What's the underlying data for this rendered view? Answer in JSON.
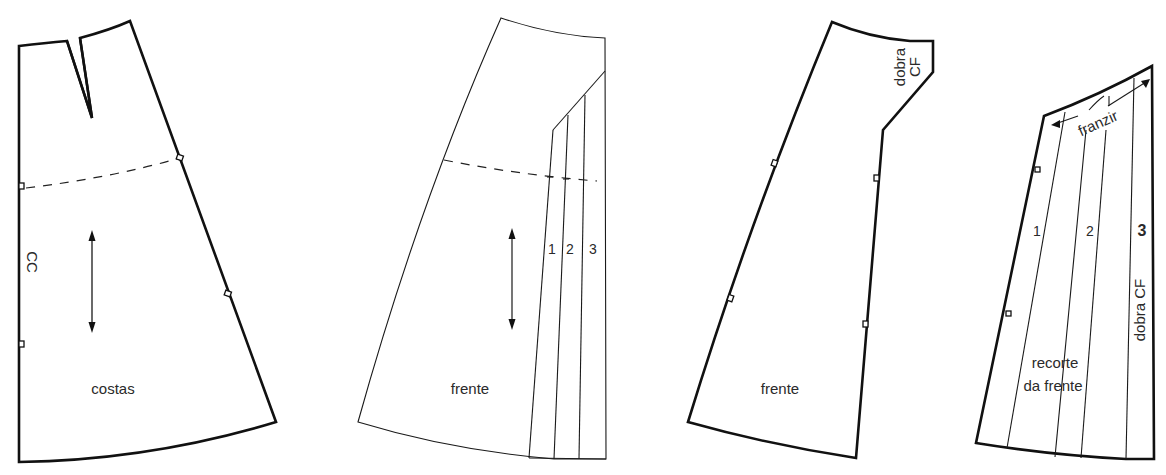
{
  "diagram": {
    "type": "sewing-pattern",
    "line_color": "#111111",
    "background": "#ffffff",
    "pieces": [
      {
        "id": "piece-1",
        "name": "costas",
        "label": "costas",
        "edge_label": "CC",
        "has_dart": true,
        "has_grainline": true,
        "has_hipline": true
      },
      {
        "id": "piece-2",
        "name": "frente (slash lines)",
        "label": "frente",
        "slash_labels": [
          "1",
          "2",
          "3"
        ],
        "has_grainline": true,
        "has_hipline": true
      },
      {
        "id": "piece-3",
        "name": "frente",
        "label": "frente",
        "fold_label_line1": "dobra",
        "fold_label_line2": "CF"
      },
      {
        "id": "piece-4",
        "name": "recorte da frente",
        "label_line1": "recorte",
        "label_line2": "da frente",
        "slash_labels": [
          "1",
          "2",
          "3"
        ],
        "gather_label": "franzir",
        "fold_label": "dobra CF"
      }
    ]
  }
}
